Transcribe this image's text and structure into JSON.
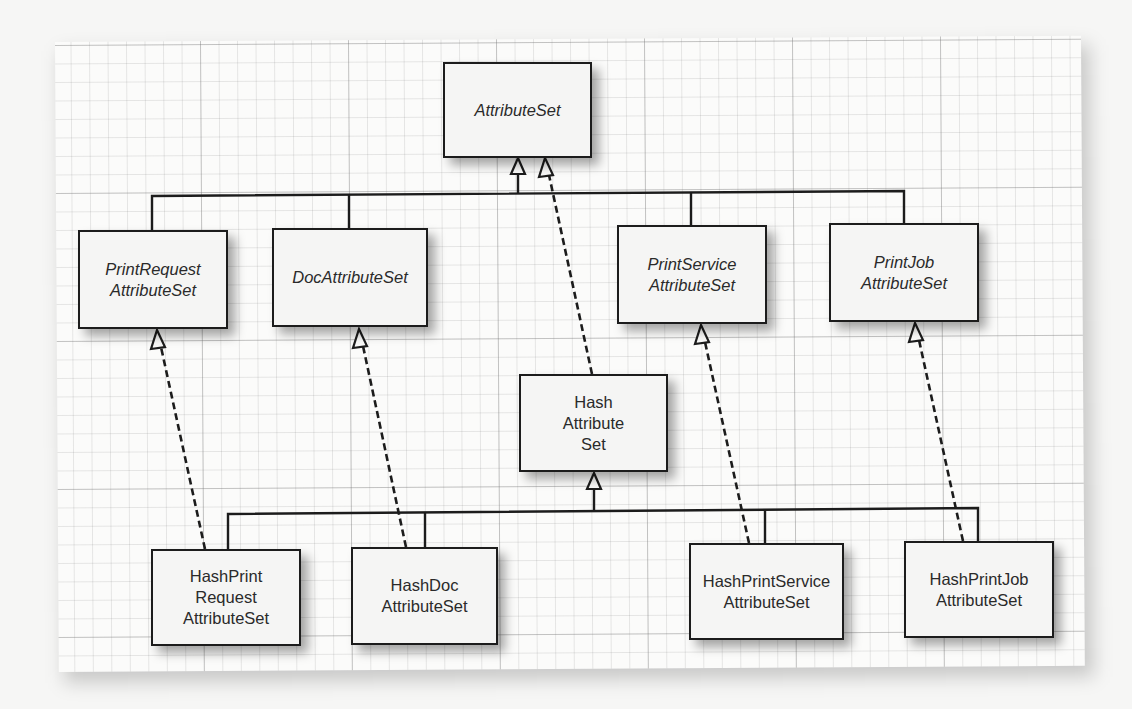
{
  "diagram": {
    "colors": {
      "line": "#1c1c1c",
      "box_fill": "#f5f5f4",
      "text": "#2a2a2a",
      "grid_minor": "#c8c8c8",
      "grid_major": "#a8a8a8"
    },
    "nodes": {
      "attribute_set": {
        "label": "AttributeSet",
        "kind": "interface"
      },
      "print_request_attribute_set": {
        "label": "PrintRequest\nAttributeSet",
        "kind": "interface"
      },
      "doc_attribute_set": {
        "label": "DocAttributeSet",
        "kind": "interface"
      },
      "print_service_attribute_set": {
        "label": "PrintService\nAttributeSet",
        "kind": "interface"
      },
      "print_job_attribute_set": {
        "label": "PrintJob\nAttributeSet",
        "kind": "interface"
      },
      "hash_attribute_set": {
        "label": "Hash\nAttribute\nSet",
        "kind": "class"
      },
      "hash_print_request_attribute_set": {
        "label": "HashPrint\nRequest\nAttributeSet",
        "kind": "class"
      },
      "hash_doc_attribute_set": {
        "label": "HashDoc\nAttributeSet",
        "kind": "class"
      },
      "hash_print_service_attribute_set": {
        "label": "HashPrintService\nAttributeSet",
        "kind": "class"
      },
      "hash_print_job_attribute_set": {
        "label": "HashPrintJob\nAttributeSet",
        "kind": "class"
      }
    },
    "edges": [
      {
        "from": "PrintRequestAttributeSet",
        "to": "AttributeSet",
        "type": "extends",
        "style": "solid"
      },
      {
        "from": "DocAttributeSet",
        "to": "AttributeSet",
        "type": "extends",
        "style": "solid"
      },
      {
        "from": "PrintServiceAttributeSet",
        "to": "AttributeSet",
        "type": "extends",
        "style": "solid"
      },
      {
        "from": "PrintJobAttributeSet",
        "to": "AttributeSet",
        "type": "extends",
        "style": "solid"
      },
      {
        "from": "HashAttributeSet",
        "to": "AttributeSet",
        "type": "implements",
        "style": "dashed"
      },
      {
        "from": "HashPrintRequestAttributeSet",
        "to": "HashAttributeSet",
        "type": "extends",
        "style": "solid"
      },
      {
        "from": "HashDocAttributeSet",
        "to": "HashAttributeSet",
        "type": "extends",
        "style": "solid"
      },
      {
        "from": "HashPrintServiceAttributeSet",
        "to": "HashAttributeSet",
        "type": "extends",
        "style": "solid"
      },
      {
        "from": "HashPrintJobAttributeSet",
        "to": "HashAttributeSet",
        "type": "extends",
        "style": "solid"
      },
      {
        "from": "HashPrintRequestAttributeSet",
        "to": "PrintRequestAttributeSet",
        "type": "implements",
        "style": "dashed"
      },
      {
        "from": "HashDocAttributeSet",
        "to": "DocAttributeSet",
        "type": "implements",
        "style": "dashed"
      },
      {
        "from": "HashPrintServiceAttributeSet",
        "to": "PrintServiceAttributeSet",
        "type": "implements",
        "style": "dashed"
      },
      {
        "from": "HashPrintJobAttributeSet",
        "to": "PrintJobAttributeSet",
        "type": "implements",
        "style": "dashed"
      }
    ]
  }
}
